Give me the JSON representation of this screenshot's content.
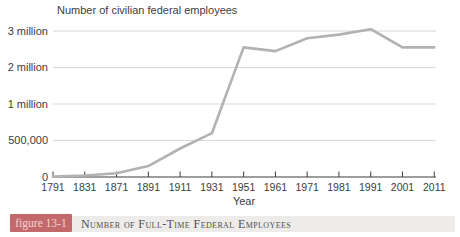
{
  "chart_data": {
    "type": "line",
    "title": "Number of civilian federal employees",
    "xlabel": "Year",
    "categories": [
      "1791",
      "1831",
      "1871",
      "1891",
      "1911",
      "1931",
      "1951",
      "1961",
      "1971",
      "1981",
      "1991",
      "2001",
      "2011"
    ],
    "values": [
      5000,
      20000,
      51000,
      150000,
      390000,
      600000,
      2550000,
      2450000,
      2800000,
      2900000,
      3050000,
      2550000,
      2550000
    ],
    "y_axis": {
      "tick_labels": [
        "0",
        "500,000",
        "1 million",
        "2 million",
        "3 million"
      ],
      "tick_values": [
        0,
        500000,
        1000000,
        2000000,
        3000000
      ],
      "scale": "piecewise-linear-equal-tick-spacing",
      "range": [
        0,
        3000000
      ]
    },
    "grid": true,
    "legend": "none",
    "colors": {
      "line": "#b2b2b2",
      "grid": "#d8d8d8",
      "axis": "#3c3c3c",
      "text": "#3d3d3d"
    }
  },
  "caption": {
    "badge_label": "figure 13-1",
    "text": "Number of Full-Time Federal Employees"
  },
  "colors": {
    "badge_bg": "#c4696b",
    "badge_text": "#f2d3d3",
    "caption_strip_bg": "#edecea",
    "caption_text": "#4f4f4f",
    "background": "#ffffff"
  }
}
